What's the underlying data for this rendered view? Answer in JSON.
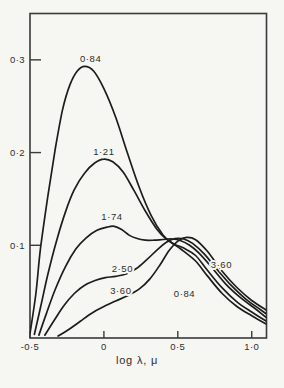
{
  "figure": {
    "background": "#f6f6f2",
    "line_color": "#1d1d1d",
    "frame_color": "#3a3a3a",
    "text_color": "#2e2e2e"
  },
  "chart_data": {
    "type": "line",
    "title": "",
    "xlabel": "log λ, μ",
    "ylabel": "",
    "xlim": [
      -0.5,
      1.1
    ],
    "ylim": [
      0,
      0.35
    ],
    "grid": false,
    "legend": "inline labels on curves",
    "x_ticks": [
      {
        "value": -0.5,
        "label": "-0·5"
      },
      {
        "value": 0.0,
        "label": "0"
      },
      {
        "value": 0.5,
        "label": "0·5"
      },
      {
        "value": 1.0,
        "label": "1·0"
      }
    ],
    "y_ticks": [
      {
        "value": 0.1,
        "label": "0·1"
      },
      {
        "value": 0.2,
        "label": "0·2"
      },
      {
        "value": 0.3,
        "label": "0·3"
      }
    ],
    "series": [
      {
        "name": "0·84",
        "points": [
          [
            -0.5,
            0.005
          ],
          [
            -0.46,
            0.048
          ],
          [
            -0.43,
            0.095
          ],
          [
            -0.38,
            0.152
          ],
          [
            -0.33,
            0.203
          ],
          [
            -0.28,
            0.246
          ],
          [
            -0.23,
            0.273
          ],
          [
            -0.18,
            0.288
          ],
          [
            -0.13,
            0.293
          ],
          [
            -0.07,
            0.288
          ],
          [
            0.0,
            0.269
          ],
          [
            0.08,
            0.238
          ],
          [
            0.16,
            0.199
          ],
          [
            0.24,
            0.162
          ],
          [
            0.32,
            0.132
          ],
          [
            0.4,
            0.111
          ],
          [
            0.46,
            0.1025
          ],
          [
            0.52,
            0.096
          ],
          [
            0.62,
            0.083
          ],
          [
            0.7,
            0.067
          ],
          [
            0.8,
            0.048
          ],
          [
            0.9,
            0.034
          ],
          [
            1.0,
            0.024
          ],
          [
            1.1,
            0.015
          ]
        ]
      },
      {
        "name": "1·21",
        "points": [
          [
            -0.47,
            0.004
          ],
          [
            -0.43,
            0.032
          ],
          [
            -0.38,
            0.068
          ],
          [
            -0.32,
            0.105
          ],
          [
            -0.26,
            0.136
          ],
          [
            -0.2,
            0.16
          ],
          [
            -0.13,
            0.178
          ],
          [
            -0.06,
            0.189
          ],
          [
            0.0,
            0.193
          ],
          [
            0.06,
            0.19
          ],
          [
            0.13,
            0.179
          ],
          [
            0.2,
            0.16
          ],
          [
            0.28,
            0.137
          ],
          [
            0.36,
            0.117
          ],
          [
            0.42,
            0.107
          ],
          [
            0.48,
            0.101
          ],
          [
            0.54,
            0.097
          ],
          [
            0.62,
            0.089
          ],
          [
            0.7,
            0.073
          ],
          [
            0.8,
            0.054
          ],
          [
            0.9,
            0.039
          ],
          [
            1.0,
            0.028
          ],
          [
            1.1,
            0.018
          ]
        ]
      },
      {
        "name": "1·74",
        "points": [
          [
            -0.44,
            0.003
          ],
          [
            -0.39,
            0.026
          ],
          [
            -0.33,
            0.052
          ],
          [
            -0.26,
            0.077
          ],
          [
            -0.19,
            0.096
          ],
          [
            -0.12,
            0.108
          ],
          [
            -0.05,
            0.116
          ],
          [
            0.02,
            0.1195
          ],
          [
            0.07,
            0.1205
          ],
          [
            0.12,
            0.117
          ],
          [
            0.17,
            0.111
          ],
          [
            0.22,
            0.1075
          ],
          [
            0.28,
            0.1055
          ],
          [
            0.34,
            0.1055
          ],
          [
            0.4,
            0.1062
          ],
          [
            0.46,
            0.1068
          ],
          [
            0.52,
            0.105
          ],
          [
            0.58,
            0.1
          ],
          [
            0.64,
            0.092
          ],
          [
            0.72,
            0.078
          ],
          [
            0.82,
            0.059
          ],
          [
            0.92,
            0.044
          ],
          [
            1.02,
            0.032
          ],
          [
            1.1,
            0.022
          ]
        ]
      },
      {
        "name": "2·50",
        "points": [
          [
            -0.4,
            0.003
          ],
          [
            -0.34,
            0.018
          ],
          [
            -0.27,
            0.035
          ],
          [
            -0.2,
            0.048
          ],
          [
            -0.13,
            0.057
          ],
          [
            -0.06,
            0.062
          ],
          [
            0.01,
            0.065
          ],
          [
            0.08,
            0.0665
          ],
          [
            0.15,
            0.069
          ],
          [
            0.22,
            0.075
          ],
          [
            0.29,
            0.0845
          ],
          [
            0.36,
            0.095
          ],
          [
            0.42,
            0.103
          ],
          [
            0.48,
            0.1072
          ],
          [
            0.54,
            0.1068
          ],
          [
            0.6,
            0.102
          ],
          [
            0.68,
            0.0905
          ],
          [
            0.76,
            0.075
          ],
          [
            0.86,
            0.057
          ],
          [
            0.96,
            0.042
          ],
          [
            1.06,
            0.0305
          ],
          [
            1.1,
            0.026
          ]
        ]
      },
      {
        "name": "3·60",
        "points": [
          [
            -0.31,
            0.002
          ],
          [
            -0.24,
            0.009
          ],
          [
            -0.16,
            0.018
          ],
          [
            -0.08,
            0.027
          ],
          [
            0.0,
            0.034
          ],
          [
            0.08,
            0.04
          ],
          [
            0.16,
            0.0455
          ],
          [
            0.24,
            0.053
          ],
          [
            0.31,
            0.0635
          ],
          [
            0.38,
            0.079
          ],
          [
            0.44,
            0.094
          ],
          [
            0.5,
            0.1045
          ],
          [
            0.56,
            0.1085
          ],
          [
            0.62,
            0.106
          ],
          [
            0.7,
            0.0935
          ],
          [
            0.8,
            0.072
          ],
          [
            0.9,
            0.0545
          ],
          [
            1.0,
            0.0405
          ],
          [
            1.1,
            0.03
          ]
        ]
      }
    ],
    "annotations": [
      {
        "label": "0·84",
        "x": -0.09,
        "y": 0.302,
        "for_series": "0·84"
      },
      {
        "label": "1·21",
        "x": 0.0,
        "y": 0.201,
        "for_series": "1·21"
      },
      {
        "label": "1·74",
        "x": 0.055,
        "y": 0.131,
        "for_series": "1·74"
      },
      {
        "label": "2·50",
        "x": 0.125,
        "y": 0.0755,
        "for_series": "2·50"
      },
      {
        "label": "3·60",
        "x": 0.115,
        "y": 0.0515,
        "for_series": "3·60"
      },
      {
        "label": "3·60",
        "x": 0.795,
        "y": 0.0795,
        "for_series": "3·60"
      },
      {
        "label": "0·84",
        "x": 0.545,
        "y": 0.048,
        "for_series": "0·84"
      }
    ]
  }
}
